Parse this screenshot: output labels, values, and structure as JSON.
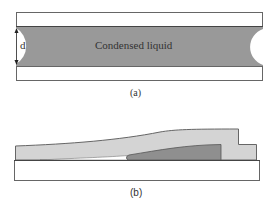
{
  "figure_a": {
    "liquid_label": "Condensed liquid",
    "dimension_label": "d",
    "caption": "(a)",
    "colors": {
      "plate_fill": "#ffffff",
      "plate_stroke": "#555555",
      "liquid_fill": "#999999"
    }
  },
  "figure_b": {
    "caption": "(b)",
    "colors": {
      "substrate_fill": "#ffffff",
      "film_fill": "#d4d4d4",
      "liquid_fill": "#8f8f8f",
      "stroke": "#555555"
    }
  }
}
